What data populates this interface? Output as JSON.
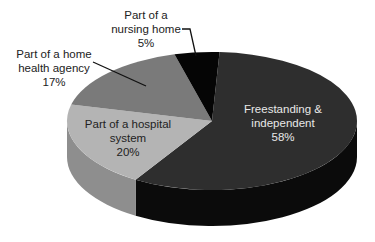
{
  "chart_data": {
    "type": "pie",
    "style": "3d",
    "title": "",
    "slices": [
      {
        "label_lines": [
          "Freestanding &",
          "independent"
        ],
        "label": "Freestanding & independent",
        "value": 58,
        "value_label": "58%",
        "top_color": "#2e2e2e",
        "side_color": "#0b0b0b"
      },
      {
        "label_lines": [
          "Part of a hospital",
          "system"
        ],
        "label": "Part of a hospital system",
        "value": 20,
        "value_label": "20%",
        "top_color": "#b4b4b4",
        "side_color": "#8e8e8e"
      },
      {
        "label_lines": [
          "Part of a home",
          "health agency"
        ],
        "label": "Part of a home health agency",
        "value": 17,
        "value_label": "17%",
        "top_color": "#7a7a7a",
        "side_color": "#5a5a5a"
      },
      {
        "label_lines": [
          "Part of a",
          "nursing home"
        ],
        "label": "Part of a nursing home",
        "value": 5,
        "value_label": "5%",
        "top_color": "#050505",
        "side_color": "#000000"
      }
    ],
    "legend": "none",
    "labels": "data labels with category name and percentage"
  }
}
